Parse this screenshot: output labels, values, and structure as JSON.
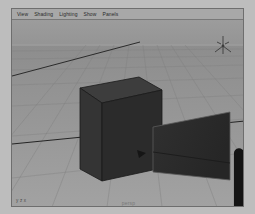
{
  "app": {
    "name": "3D Modeling Viewport",
    "panel_background": "#9a9a9a"
  },
  "menubar": {
    "items": [
      {
        "label": "View"
      },
      {
        "label": "Shading"
      },
      {
        "label": "Lighting"
      },
      {
        "label": "Show"
      },
      {
        "label": "Panels"
      }
    ]
  },
  "viewport": {
    "camera_label": "persp",
    "axis_label": "y z x",
    "background_color": "#8f8f8f",
    "grid_color": "#7d7d7d",
    "horizon_color": "#9d9d9d",
    "axis_line_color": "#2e2e2e",
    "objects": [
      {
        "name": "polygon-cube",
        "type": "cube",
        "fill_top": "#3a3a3a",
        "fill_front": "#303030",
        "fill_side": "#272727",
        "edge_color": "#1c1c1c"
      },
      {
        "name": "polygon-plane",
        "type": "plane",
        "fill": "#2b2b2b",
        "edge_color": "#565656"
      },
      {
        "name": "directional-light",
        "type": "light",
        "color": "#3a3a3a"
      }
    ]
  },
  "cursor": {
    "name": "mouse-pointer",
    "fill": "#f2f2f2",
    "stroke": "#161616"
  }
}
